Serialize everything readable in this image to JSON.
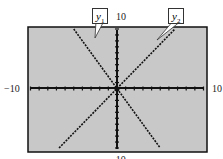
{
  "chart_data": {
    "type": "line",
    "title": "",
    "xlabel": "",
    "ylabel": "",
    "xlim": [
      -10,
      10
    ],
    "ylim": [
      -10,
      10
    ],
    "x_tick_labels": {
      "min": "−10",
      "max": "10"
    },
    "y_tick_labels": {
      "min": "−10",
      "max": "10"
    },
    "tick_spacing": 1,
    "grid": false,
    "background": "#c8c8c8",
    "series": [
      {
        "name": "y1",
        "label_main": "y",
        "label_sub": "1",
        "slope": -2,
        "intercept": 0,
        "points": [
          [
            -5,
            10
          ],
          [
            0,
            0
          ],
          [
            5,
            -10
          ]
        ]
      },
      {
        "name": "y2",
        "label_main": "y",
        "label_sub": "2",
        "slope": 1.5,
        "intercept": 0,
        "points": [
          [
            -6.7,
            -10
          ],
          [
            0,
            0
          ],
          [
            6.7,
            10
          ]
        ]
      }
    ]
  }
}
